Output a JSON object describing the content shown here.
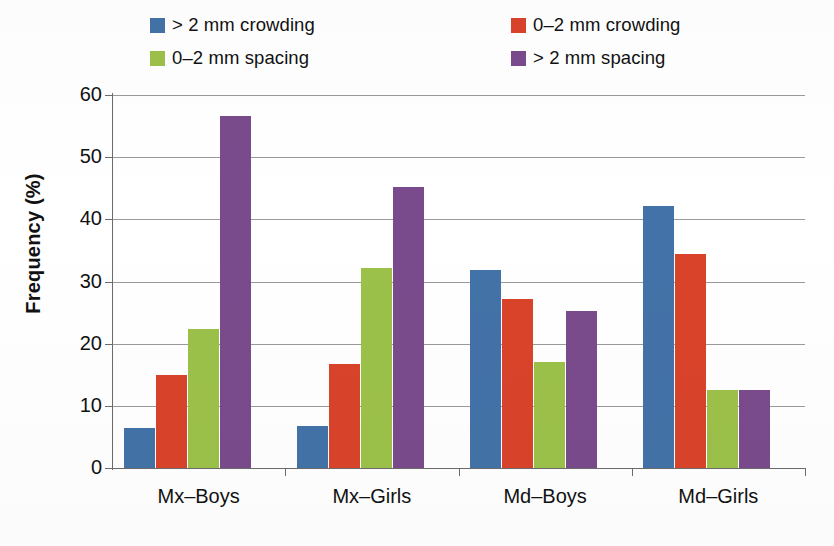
{
  "chart_data": {
    "type": "bar",
    "title": "",
    "xlabel": "",
    "ylabel": "Frequency (%)",
    "ylim": [
      0,
      60
    ],
    "ytick_values": [
      0,
      10,
      20,
      30,
      40,
      50,
      60
    ],
    "ytick_labels": [
      "0",
      "10",
      "20",
      "30",
      "40",
      "50",
      "60"
    ],
    "grid": "horizontal",
    "legend_position": "top",
    "legend_columns": 2,
    "categories": [
      "Mx–Boys",
      "Mx–Girls",
      "Md–Boys",
      "Md–Girls"
    ],
    "series": [
      {
        "name": "> 2 mm crowding",
        "color": "#4372a8",
        "values": [
          6.5,
          6.8,
          31.8,
          42.1
        ]
      },
      {
        "name": "0–2 mm crowding",
        "color": "#d9432a",
        "values": [
          14.9,
          16.7,
          27.2,
          34.4
        ]
      },
      {
        "name": "0–2 mm spacing",
        "color": "#9cc14a",
        "values": [
          22.3,
          32.1,
          17.0,
          12.5
        ]
      },
      {
        "name": "> 2 mm spacing",
        "color": "#7a4b8c",
        "values": [
          56.7,
          45.2,
          25.3,
          12.5
        ]
      }
    ]
  },
  "axis": {
    "ylabel": "Frequency (%)"
  },
  "colors": {
    "series_blue": "#4372a8",
    "series_red": "#d9432a",
    "series_green": "#9cc14a",
    "series_purple": "#7a4b8c",
    "gridline": "#9a9a9a",
    "axis": "#6b6b6b",
    "text": "#111111",
    "background": "#ffffff"
  }
}
